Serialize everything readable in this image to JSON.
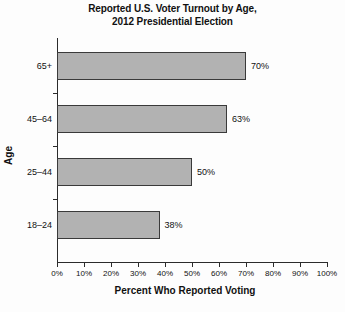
{
  "chart_data": {
    "type": "bar",
    "orientation": "horizontal",
    "title": "Reported U.S. Voter Turnout by Age, 2012 Presidential Election",
    "title_lines": [
      "Reported U.S. Voter Turnout by Age,",
      "2012 Presidential Election"
    ],
    "categories": [
      "65+",
      "45–64",
      "25–44",
      "18–24"
    ],
    "values": [
      70,
      63,
      50,
      38
    ],
    "value_labels": [
      "70%",
      "63%",
      "50%",
      "38%"
    ],
    "xlabel": "Percent Who Reported Voting",
    "ylabel": "Age",
    "xlim": [
      0,
      100
    ],
    "xtick_values": [
      0,
      10,
      20,
      30,
      40,
      50,
      60,
      70,
      80,
      90,
      100
    ],
    "xtick_labels": [
      "0%",
      "10%",
      "20%",
      "30%",
      "40%",
      "50%",
      "60%",
      "70%",
      "80%",
      "90%",
      "100%"
    ],
    "grid": false,
    "legend": null,
    "colors": {
      "bar_fill": "#b2b2b2",
      "bar_edge": "#3a3a3a",
      "axis": "#2b2b2b",
      "text": "#111111",
      "background": "#fdfdfd"
    }
  }
}
